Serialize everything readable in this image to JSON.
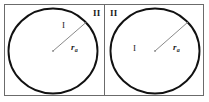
{
  "figure": {
    "width": 209,
    "height": 102,
    "background_color": "#ffffff",
    "border_color": "#6b6b6b",
    "circle_stroke_color": "#111111",
    "radius_line_color": "#8a8a8a",
    "text_color": "#1a1a1a"
  },
  "panels": [
    {
      "id": "left-panel",
      "outer_region_label": "II",
      "inner_region_label": "I",
      "radius_label_variable": "r",
      "radius_label_subscript": "a",
      "circle": {
        "cx": 53,
        "cy": 51,
        "rx": 44.5,
        "ry": 42.5
      },
      "radius_line": {
        "x1": 53,
        "y1": 51,
        "x2": 86.5,
        "y2": 22
      }
    },
    {
      "id": "right-panel",
      "outer_region_label": "II",
      "inner_region_label": "I",
      "radius_label_variable": "r",
      "radius_label_subscript": "a",
      "circle": {
        "cx": 155,
        "cy": 51,
        "rx": 44.5,
        "ry": 42.5
      },
      "radius_line": {
        "x1": 155,
        "y1": 51,
        "x2": 188,
        "y2": 22
      }
    }
  ],
  "frame": {
    "outer_rect": {
      "x": 4.5,
      "y": 4.5,
      "width": 199,
      "height": 91
    },
    "divider_x": 104.5
  }
}
